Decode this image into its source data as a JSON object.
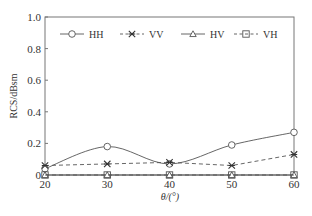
{
  "chart_data": {
    "type": "line",
    "title": "",
    "xlabel": "θ/(°)",
    "ylabel": "RCS/dBsm",
    "x": [
      20,
      30,
      40,
      50,
      60
    ],
    "xticks": [
      "20",
      "30",
      "40",
      "50",
      "60"
    ],
    "yticks": [
      "0",
      "0.2",
      "0.4",
      "0.6",
      "0.8",
      "1.0"
    ],
    "xlim": [
      20,
      60
    ],
    "ylim": [
      0,
      1.0
    ],
    "grid": false,
    "legend_position": "top-inside",
    "series": [
      {
        "name": "HH",
        "marker": "circle",
        "linestyle": "solid",
        "smooth": true,
        "values": [
          0.04,
          0.18,
          0.07,
          0.19,
          0.27
        ]
      },
      {
        "name": "VV",
        "marker": "x-star",
        "linestyle": "dashed",
        "smooth": false,
        "values": [
          0.06,
          0.07,
          0.08,
          0.06,
          0.13
        ]
      },
      {
        "name": "HV",
        "marker": "triangle",
        "linestyle": "solid",
        "smooth": false,
        "values": [
          0.0,
          0.0,
          0.0,
          0.0,
          0.0
        ]
      },
      {
        "name": "VH",
        "marker": "square",
        "linestyle": "dashed",
        "smooth": false,
        "values": [
          0.0,
          0.0,
          0.0,
          0.0,
          0.0
        ]
      }
    ]
  },
  "legend": {
    "items": [
      "HH",
      "VV",
      "HV",
      "VH"
    ]
  },
  "axes": {
    "xlabel": "θ/(°)",
    "ylabel": "RCS/dBsm"
  },
  "colors": {
    "line": "#555555",
    "frame": "#777777",
    "text": "#333333"
  }
}
